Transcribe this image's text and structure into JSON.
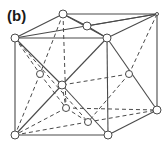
{
  "panel_label": "(b)",
  "colors": {
    "line": "#4a4a4a",
    "node_fill": "#ffffff",
    "node_stroke": "#4a4a4a",
    "background": "#ffffff"
  },
  "nodes": [
    {
      "id": "BLT",
      "x": 63,
      "y": 14,
      "r": 4
    },
    {
      "id": "BRT",
      "x": 157,
      "y": 14,
      "r": 1.5
    },
    {
      "id": "FLT",
      "x": 15,
      "y": 38,
      "r": 4
    },
    {
      "id": "TOPMID",
      "x": 87,
      "y": 26,
      "r": 4
    },
    {
      "id": "FRT_MID",
      "x": 107,
      "y": 38,
      "r": 4
    },
    {
      "id": "CENTER",
      "x": 62,
      "y": 85,
      "r": 4
    },
    {
      "id": "LEFTMID",
      "x": 40,
      "y": 74,
      "r": 3.5
    },
    {
      "id": "RIGHTMID",
      "x": 129,
      "y": 74,
      "r": 3.5
    },
    {
      "id": "BACKBOTMID",
      "x": 66,
      "y": 108,
      "r": 3.5
    },
    {
      "id": "BOTMID",
      "x": 88,
      "y": 122,
      "r": 3.5
    },
    {
      "id": "FLB",
      "x": 15,
      "y": 135,
      "r": 4
    },
    {
      "id": "FRB",
      "x": 108,
      "y": 135,
      "r": 4
    },
    {
      "id": "BRB",
      "x": 157,
      "y": 110,
      "r": 4
    }
  ],
  "solid_edges": [
    [
      "BLT",
      "BRT"
    ],
    [
      "BLT",
      "FLT"
    ],
    [
      "FLT",
      "BRT"
    ],
    [
      "FLT",
      "FRT_MID"
    ],
    [
      "BLT",
      "TOPMID"
    ],
    [
      "TOPMID",
      "FRT_MID"
    ],
    [
      "TOPMID",
      "BRT"
    ],
    [
      "FRT_MID",
      "BRT"
    ],
    [
      "BRT",
      "BRB"
    ],
    [
      "FLT",
      "FLB"
    ],
    [
      "FLB",
      "FRB"
    ],
    [
      "FRT_MID",
      "FRB"
    ],
    [
      "FRB",
      "BRB"
    ],
    [
      "FLT",
      "CENTER"
    ],
    [
      "CENTER",
      "FRB"
    ],
    [
      "FRT_MID",
      "CENTER"
    ],
    [
      "CENTER",
      "FLB"
    ],
    [
      "FRT_MID",
      "BRB"
    ],
    [
      "BLT",
      "FRT_MID"
    ]
  ],
  "dashed_edges": [
    [
      "BLT",
      "BACKBOTMID"
    ],
    [
      "BLT",
      "LEFTMID"
    ],
    [
      "FLT",
      "LEFTMID"
    ],
    [
      "LEFTMID",
      "BACKBOTMID"
    ],
    [
      "LEFTMID",
      "FLB"
    ],
    [
      "BRT",
      "RIGHTMID"
    ],
    [
      "RIGHTMID",
      "BOTMID"
    ],
    [
      "RIGHTMID",
      "CENTER"
    ],
    [
      "BACKBOTMID",
      "BRB"
    ],
    [
      "BACKBOTMID",
      "FLB"
    ],
    [
      "BOTMID",
      "FLB"
    ],
    [
      "BOTMID",
      "BRB"
    ],
    [
      "BACKBOTMID",
      "BOTMID"
    ],
    [
      "CENTER",
      "BACKBOTMID"
    ],
    [
      "FLT",
      "BOTMID"
    ]
  ]
}
